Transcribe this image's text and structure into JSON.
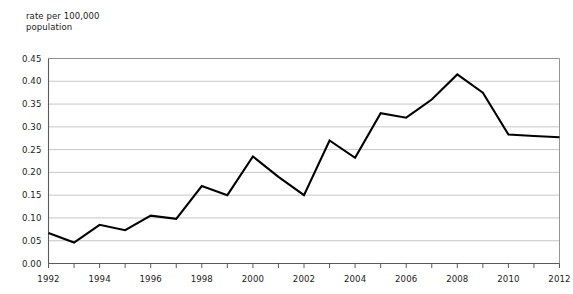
{
  "chart_data": {
    "type": "line",
    "title": "",
    "subtitle": "",
    "ylabel": "rate per 100,000\npopulation",
    "xlabel": "",
    "ylim": [
      0.0,
      0.45
    ],
    "xlim": [
      1992,
      2012
    ],
    "grid": true,
    "legend": "none",
    "y_ticks": [
      "0.00",
      "0.05",
      "0.10",
      "0.15",
      "0.20",
      "0.25",
      "0.30",
      "0.35",
      "0.40",
      "0.45"
    ],
    "y_tick_values": [
      0.0,
      0.05,
      0.1,
      0.15,
      0.2,
      0.25,
      0.3,
      0.35,
      0.4,
      0.45
    ],
    "x_ticks": [
      "1992",
      "1994",
      "1996",
      "1998",
      "2000",
      "2002",
      "2004",
      "2006",
      "2008",
      "2010",
      "2012"
    ],
    "x_tick_values": [
      1992,
      1994,
      1996,
      1998,
      2000,
      2002,
      2004,
      2006,
      2008,
      2010,
      2012
    ],
    "x_minor_tick_values": [
      1993,
      1995,
      1997,
      1999,
      2001,
      2003,
      2005,
      2007,
      2009,
      2011
    ],
    "x": [
      1992,
      1993,
      1994,
      1995,
      1996,
      1997,
      1998,
      1999,
      2000,
      2001,
      2002,
      2003,
      2004,
      2005,
      2006,
      2007,
      2008,
      2009,
      2010,
      2011,
      2012
    ],
    "categories": [
      "1992",
      "1993",
      "1994",
      "1995",
      "1996",
      "1997",
      "1998",
      "1999",
      "2000",
      "2001",
      "2002",
      "2003",
      "2004",
      "2005",
      "2006",
      "2007",
      "2008",
      "2009",
      "2010",
      "2011",
      "2012"
    ],
    "values": [
      0.067,
      0.046,
      0.085,
      0.073,
      0.105,
      0.098,
      0.17,
      0.15,
      0.235,
      0.19,
      0.15,
      0.27,
      0.232,
      0.33,
      0.32,
      0.36,
      0.415,
      0.375,
      0.283,
      0.28,
      0.277
    ],
    "series": [
      {
        "name": "rate per 100,000 population",
        "color": "#000000",
        "values": [
          0.067,
          0.046,
          0.085,
          0.073,
          0.105,
          0.098,
          0.17,
          0.15,
          0.235,
          0.19,
          0.15,
          0.27,
          0.232,
          0.33,
          0.32,
          0.36,
          0.415,
          0.375,
          0.283,
          0.28,
          0.277
        ]
      }
    ],
    "colors": {
      "line": "#000000",
      "gridline": "#b9b9b9",
      "axis": "#5a5a5a",
      "frame": "#8a8a8a",
      "text": "#1a1a1a",
      "background": "#ffffff"
    }
  }
}
